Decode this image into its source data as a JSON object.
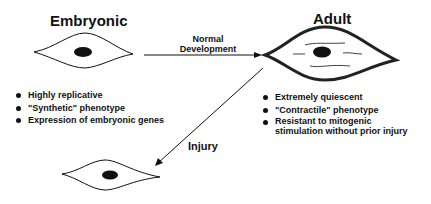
{
  "embryonic": {
    "title": "Embryonic",
    "traits": [
      "Highly replicative",
      "\"Synthetic\" phenotype",
      "Expression of embryonic genes"
    ]
  },
  "transition": {
    "normal_label_line1": "Normal",
    "normal_label_line2": "Development",
    "injury_label": "Injury"
  },
  "adult": {
    "title": "Adult",
    "traits": [
      "Extremely quiescent",
      "\"Contractile\" phenotype",
      "Resistant to mitogenic",
      "stimulation without prior injury"
    ]
  }
}
